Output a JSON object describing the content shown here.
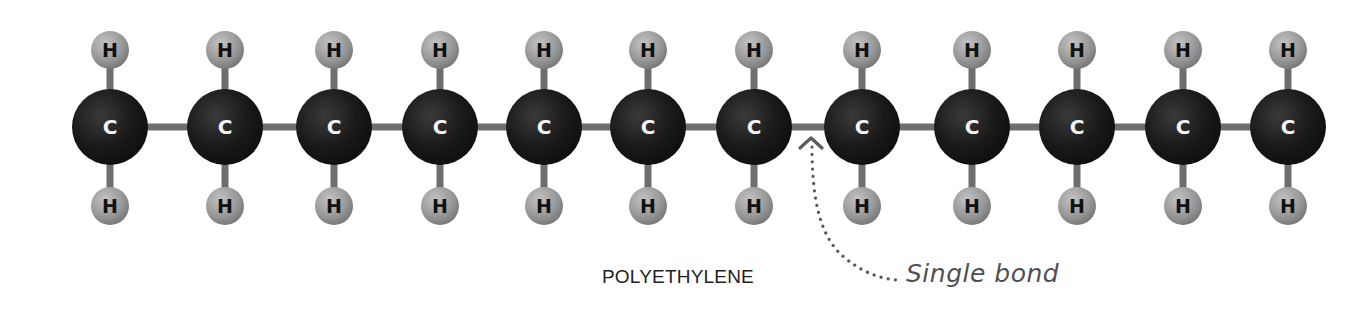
{
  "diagram": {
    "title": "POLYETHYLENE",
    "annotation": "Single bond",
    "chain": {
      "carbon_count": 12,
      "carbon_label": "C",
      "hydrogen_label": "H",
      "hydrogens_per_carbon": {
        "top": 1,
        "bottom": 1
      }
    },
    "annotated_bond_index": 6,
    "colors": {
      "carbon": "#151515",
      "carbon_highlight": "#3a3a3a",
      "hydrogen": "#8a8a8a",
      "hydrogen_highlight": "#c4c4c4",
      "bond": "#6e6e6e",
      "arrow": "#5a5a5a",
      "caption_text": "#1e1e1e",
      "annotation_text": "#505050"
    }
  }
}
